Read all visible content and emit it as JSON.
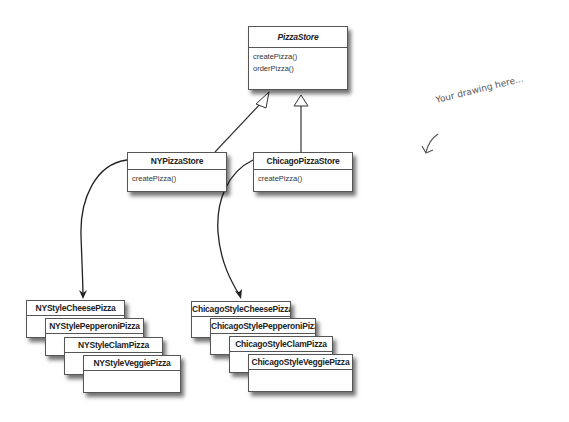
{
  "diagram": {
    "abstract_class": {
      "name": "PizzaStore",
      "methods": [
        "createPizza()",
        "orderPizza()"
      ]
    },
    "stores": [
      {
        "name": "NYPizzaStore",
        "methods": [
          "createPizza()"
        ]
      },
      {
        "name": "ChicagoPizzaStore",
        "methods": [
          "createPizza()"
        ]
      }
    ],
    "ny_products": [
      "NYStyleCheesePizza",
      "NYStylePepperoniPizza",
      "NYStyleClamPizza",
      "NYStyleVeggiePizza"
    ],
    "chicago_products": [
      "ChicagoStyleCheesePizza",
      "ChicagoStylePepperoniPizza",
      "ChicagoStyleClamPizza",
      "ChicagoStyleVeggiePizza"
    ],
    "annotation": "Your drawing here...",
    "relations": [
      {
        "from": "NYPizzaStore",
        "to": "PizzaStore",
        "type": "inheritance"
      },
      {
        "from": "ChicagoPizzaStore",
        "to": "PizzaStore",
        "type": "inheritance"
      },
      {
        "from": "NYPizzaStore",
        "to": "NYStyleCheesePizza",
        "type": "creates"
      },
      {
        "from": "ChicagoPizzaStore",
        "to": "ChicagoStyleCheesePizza",
        "type": "creates"
      }
    ],
    "colors": {
      "border": "#555555",
      "text": "#222222",
      "background": "#ffffff"
    }
  }
}
